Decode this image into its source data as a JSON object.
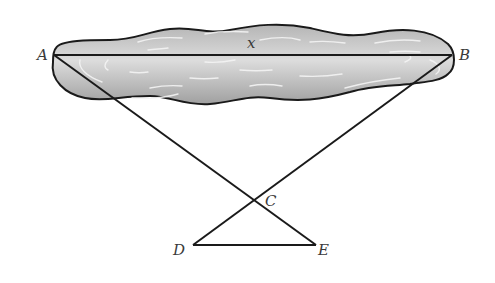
{
  "diagram": {
    "type": "geometry-lake-distance",
    "points": {
      "A": {
        "label": "A",
        "x": 54,
        "y": 55
      },
      "B": {
        "label": "B",
        "x": 452,
        "y": 55
      },
      "C": {
        "label": "C",
        "x": 253,
        "y": 200
      },
      "D": {
        "label": "D",
        "x": 193,
        "y": 245
      },
      "E": {
        "label": "E",
        "x": 316,
        "y": 245
      }
    },
    "segments": [
      "AB",
      "AE",
      "BD",
      "DE"
    ],
    "unknown_label": "x",
    "colors": {
      "line": "#1a1a1a",
      "lake_fill_light": "#d9d9d9",
      "lake_fill_dark": "#9a9a9a",
      "ripple": "#f2f2f2",
      "label": "#3a3a3a"
    }
  }
}
